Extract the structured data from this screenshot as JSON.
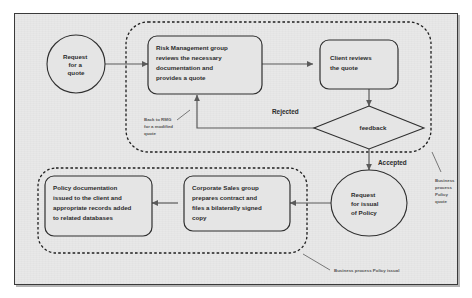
{
  "diagram": {
    "background_color": "#e8e8e8",
    "frame_border_color": "#3a3a3a",
    "shape_fill_color": "#e5e5e5",
    "shape_stroke_color": "#2f2f2f",
    "connector_color": "#5a5a5a",
    "annotation_color": "#555555"
  },
  "nodes": {
    "request_quote": {
      "shape": "ellipse",
      "lines": [
        "Request",
        "for a",
        "quote"
      ]
    },
    "risk_management": {
      "shape": "rounded-rect",
      "lines": [
        "Risk Management group",
        "reviews the necessary",
        "documentation and",
        "provides a quote"
      ]
    },
    "client_reviews": {
      "shape": "rounded-rect",
      "lines": [
        "Client reviews",
        "the quote"
      ]
    },
    "feedback_decision": {
      "shape": "diamond",
      "lines": [
        "feedback"
      ]
    },
    "request_issual": {
      "shape": "ellipse",
      "lines": [
        "Request",
        "for issual",
        "of Policy"
      ]
    },
    "corporate_sales": {
      "shape": "rounded-rect",
      "lines": [
        "Corporate Sales group",
        "prepares contract and",
        "files a bilaterally signed",
        "copy"
      ]
    },
    "policy_documentation": {
      "shape": "rounded-rect",
      "lines": [
        "Policy documentation",
        "issued to the client and",
        "appropriate records added",
        "to related databases"
      ]
    }
  },
  "edge_labels": {
    "rejected": "Rejected",
    "accepted": "Accepted"
  },
  "annotations": {
    "back_to_rmg": {
      "lines": [
        "Back to RMG",
        "for a modified",
        "quote"
      ]
    },
    "business_process_policy_quote": {
      "lines": [
        "Business",
        "process",
        "Policy",
        "quote"
      ]
    },
    "business_process_policy_issual": {
      "lines": [
        "Business process Policy issual"
      ]
    }
  },
  "groups": {
    "policy_quote_group": "Business process Policy quote",
    "policy_issual_group": "Business process Policy issual"
  }
}
